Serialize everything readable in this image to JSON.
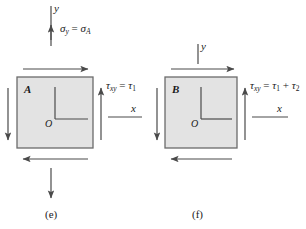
{
  "figure": {
    "type": "engineering-diagram",
    "background": "#ffffff",
    "stroke_color": "#4a4a4a",
    "square_fill": "#e3e3e3",
    "square_stroke": "#6b6b6b"
  },
  "panels": [
    {
      "id": "e",
      "caption": "(e)",
      "element_letter": "A",
      "origin_label": "O",
      "axis_y_label": "y",
      "axis_x_label": "x",
      "normal_stress_label": "σy = σA",
      "normal_stress_sigma": "σ",
      "normal_stress_sub1": "y",
      "normal_stress_eq": "=",
      "normal_stress_sigma2": "σ",
      "normal_stress_sub2": "A",
      "shear_stress_tau": "τ",
      "shear_stress_sub": "xy",
      "shear_stress_eq": "=",
      "shear_stress_value_tau": "τ",
      "shear_stress_value_sub": "1",
      "shear_stress_label": "τxy = τ1",
      "has_normal_stress_arrows": true,
      "arrows": {
        "top_shear": "right",
        "bottom_shear": "left",
        "left_shear": "down",
        "right_shear": "up",
        "top_normal": "up",
        "bottom_normal": "down"
      }
    },
    {
      "id": "f",
      "caption": "(f)",
      "element_letter": "B",
      "origin_label": "O",
      "axis_y_label": "y",
      "axis_x_label": "x",
      "shear_stress_tau": "τ",
      "shear_stress_sub": "xy",
      "shear_stress_eq": "=",
      "shear_stress_value_tau1": "τ",
      "shear_stress_value_sub1": "1",
      "shear_stress_plus": "+",
      "shear_stress_value_tau2": "τ",
      "shear_stress_value_sub2": "2",
      "shear_stress_label": "τxy = τ1 + τ2",
      "has_normal_stress_arrows": false,
      "arrows": {
        "top_shear": "right",
        "bottom_shear": "left",
        "left_shear": "down",
        "right_shear": "up"
      }
    }
  ]
}
